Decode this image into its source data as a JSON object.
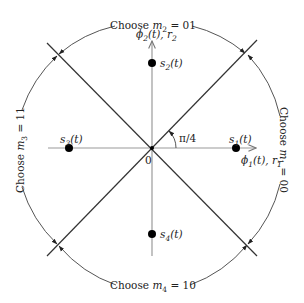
{
  "axes": {
    "horizontal": {
      "label_phi": "ϕ",
      "label_func": "1(t), r",
      "label_sub": "1",
      "full": "ϕ1(t), r1"
    },
    "vertical": {
      "label_phi": "ϕ",
      "label_func": "2(t), r",
      "label_sub": "2",
      "full": "ϕ2(t), r2"
    },
    "origin": "0",
    "angle": "π/4"
  },
  "signals": [
    {
      "id": "s1",
      "label_base": "s",
      "label_sub": "1",
      "label_tail": "(t)",
      "full": "s1(t)"
    },
    {
      "id": "s2",
      "label_base": "s",
      "label_sub": "2",
      "label_tail": "(t)",
      "full": "s2(t)"
    },
    {
      "id": "s3",
      "label_base": "s",
      "label_sub": "3",
      "label_tail": "(t)",
      "full": "s3(t)"
    },
    {
      "id": "s4",
      "label_base": "s",
      "label_sub": "4",
      "label_tail": "(t)",
      "full": "s4(t)"
    }
  ],
  "regions": [
    {
      "id": "m1",
      "prefix": "Choose ",
      "var": "m",
      "sub": "1",
      "value": " = 00",
      "full": "Choose m1 = 00"
    },
    {
      "id": "m2",
      "prefix": "Choose ",
      "var": "m",
      "sub": "2",
      "value": " = 01",
      "full": "Choose m2 = 01"
    },
    {
      "id": "m3",
      "prefix": "Choose ",
      "var": "m",
      "sub": "3",
      "value": " = 11",
      "full": "Choose m3 = 11"
    },
    {
      "id": "m4",
      "prefix": "Choose ",
      "var": "m",
      "sub": "4",
      "value": " = 10",
      "full": "Choose m4 = 10"
    }
  ],
  "colors": {
    "axis": "#9a9a9a",
    "diagonal": "#333333",
    "circle": "#555555",
    "point": "#000000",
    "text": "#222222"
  }
}
